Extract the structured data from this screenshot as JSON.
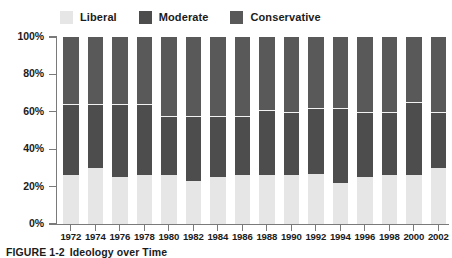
{
  "figure": {
    "caption_prefix": "FIGURE 1-2",
    "caption_title": "Ideology over Time"
  },
  "legend": {
    "position": "top",
    "entries": [
      {
        "label": "Liberal",
        "color": "#e6e6e6",
        "swatch_name": "legend-swatch-liberal"
      },
      {
        "label": "Moderate",
        "color": "#4d4d4d",
        "swatch_name": "legend-swatch-moderate"
      },
      {
        "label": "Conservative",
        "color": "#595959",
        "swatch_name": "legend-swatch-conservative"
      }
    ]
  },
  "axes": {
    "y_ticks": [
      "0%",
      "20%",
      "40%",
      "60%",
      "80%",
      "100%"
    ],
    "y_tick_values": [
      0,
      20,
      40,
      60,
      80,
      100
    ],
    "ylim": [
      0,
      100
    ],
    "xlabel": "",
    "ylabel": "",
    "grid": false
  },
  "colors": {
    "liberal": "#e6e6e6",
    "moderate": "#4d4d4d",
    "conservative": "#595959",
    "separator": "#f2f2f2",
    "axis": "#7a7a7a",
    "text": "#1b1b1b",
    "background": "#ffffff"
  },
  "chart_data": {
    "type": "bar",
    "stacked": true,
    "title": "Ideology over Time",
    "xlabel": "",
    "ylabel": "",
    "ylim": [
      0,
      100
    ],
    "grid": false,
    "legend_position": "top",
    "categories": [
      "1972",
      "1974",
      "1976",
      "1978",
      "1980",
      "1982",
      "1984",
      "1986",
      "1988",
      "1990",
      "1992",
      "1994",
      "1996",
      "1998",
      "2000",
      "2002"
    ],
    "series": [
      {
        "name": "Liberal",
        "color": "#e6e6e6",
        "values": [
          26,
          30,
          25,
          26,
          26,
          23,
          25,
          26,
          26,
          26,
          27,
          22,
          25,
          26,
          26,
          30
        ]
      },
      {
        "name": "Moderate",
        "color": "#4d4d4d",
        "values": [
          38,
          34,
          39,
          38,
          32,
          35,
          33,
          32,
          35,
          34,
          35,
          40,
          35,
          34,
          39,
          30
        ]
      },
      {
        "name": "Conservative",
        "color": "#595959",
        "values": [
          36,
          36,
          36,
          36,
          42,
          42,
          42,
          42,
          39,
          40,
          38,
          38,
          40,
          40,
          35,
          40
        ]
      }
    ],
    "cumulative_tops": {
      "liberal": [
        26,
        30,
        25,
        26,
        26,
        23,
        25,
        26,
        26,
        26,
        27,
        22,
        25,
        26,
        26,
        30
      ],
      "moderate": [
        64,
        64,
        64,
        64,
        58,
        58,
        58,
        58,
        61,
        60,
        62,
        62,
        60,
        60,
        65,
        60
      ]
    }
  }
}
